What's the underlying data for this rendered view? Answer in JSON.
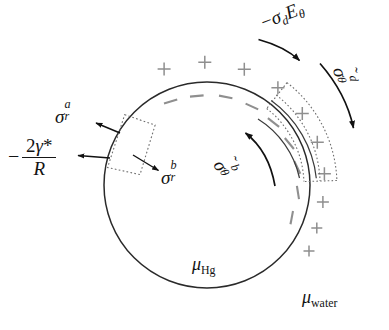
{
  "figure": {
    "background_color": "#ffffff",
    "line_color": "#262626",
    "charge_color": "#8a8a8a",
    "dotted_color": "#6e6e6e"
  },
  "labels": {
    "electric_traction": {
      "id": "minus-sigma-d-E-theta",
      "plain": "-σ_d E_θ",
      "minus": "−",
      "sigma": "σ",
      "sub": "d",
      "E": "E",
      "theta": "θ"
    },
    "sigma_theta_d": {
      "id": "sigma-tilde-theta-d",
      "plain": "σ̃_θ^d",
      "tilde": "˜",
      "sigma": "σ",
      "sub": "θ",
      "sup": "d"
    },
    "sigma_theta_b": {
      "id": "sigma-tilde-theta-b",
      "plain": "σ̃_θ^b",
      "tilde": "˜",
      "sigma": "σ",
      "sub": "θ",
      "sup": "b"
    },
    "sigma_r_a": {
      "id": "sigma-r-a",
      "plain": "σ_r^a",
      "sigma": "σ",
      "sub": "r",
      "sup": "a"
    },
    "sigma_r_b": {
      "id": "sigma-r-b",
      "plain": "σ_r^b",
      "sigma": "σ",
      "sub": "r",
      "sup": "b"
    },
    "laplace_pressure": {
      "id": "minus-two-gamma-star-over-R",
      "plain": "-2γ*/R",
      "minus": "−",
      "numerator_two": "2",
      "numerator_gamma": "γ",
      "numerator_star": "*",
      "denominator": "R"
    },
    "mu_hg": {
      "id": "mu-Hg",
      "plain": "μ_Hg",
      "mu": "μ",
      "sub": "Hg"
    },
    "mu_water": {
      "id": "mu-water",
      "plain": "μ_water",
      "mu": "μ",
      "sub": "water"
    }
  },
  "geometry": {
    "drop": {
      "cx": 207,
      "cy": 185,
      "r": 103
    },
    "charge_plus_radius": 118,
    "charge_minus_radius": 92,
    "plus_symbol": "+",
    "minus_symbol": "−"
  },
  "charges": {
    "plus_angles_deg": [
      -14,
      -3,
      9,
      22,
      35,
      48,
      62,
      77,
      92,
      108
    ],
    "minus_angles_deg": [
      -8,
      4,
      16,
      29,
      42,
      56,
      70,
      85,
      100
    ]
  }
}
